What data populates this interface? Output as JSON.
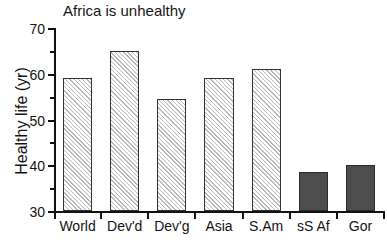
{
  "chart_data": {
    "type": "bar",
    "title": "Africa is unhealthy",
    "xlabel": "",
    "ylabel": "Healthy life (yr)",
    "categories": [
      "World",
      "Dev'd",
      "Dev'g",
      "Asia",
      "S.Am",
      "sS Af",
      "Gor"
    ],
    "values": [
      59,
      65,
      54.5,
      59,
      61,
      38.5,
      40
    ],
    "ylim": [
      30,
      70
    ],
    "yticks": [
      30,
      40,
      50,
      60,
      70
    ],
    "ytick_labels": [
      "30",
      "40",
      "50",
      "60",
      "70"
    ],
    "grid": false,
    "legend": null,
    "bar_styles": [
      "hatched",
      "hatched",
      "hatched",
      "hatched",
      "hatched",
      "solid",
      "solid"
    ],
    "colors": {
      "hatch_line": "#b9b9b9",
      "hatch_background": "#ffffff",
      "solid_fill": "#4d4d4d",
      "bar_edge": "#333333",
      "axis": "#111111",
      "text": "#141414"
    }
  }
}
